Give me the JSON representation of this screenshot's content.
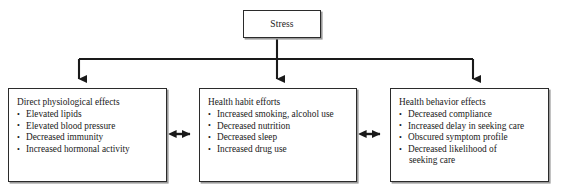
{
  "diagram": {
    "colors": {
      "box_border": "#2b2b2b",
      "box_fill": "#ffffff",
      "connector": "#1a1a1a",
      "shadow": "#9a9a9a"
    },
    "root": {
      "label": "Stress"
    },
    "nodes": [
      {
        "id": "direct-physiological-effects",
        "heading": "Direct physiological effects",
        "bullets": [
          "Elevated lipids",
          "Elevated blood pressure",
          "Decreased immunity",
          "Increased hormonal activity"
        ]
      },
      {
        "id": "health-habit-efforts",
        "heading": "Health habit efforts",
        "bullets": [
          "Increased smoking, alcohol use",
          "Decreased nutrition",
          "Decreased sleep",
          "Increased drug use"
        ]
      },
      {
        "id": "health-behavior-effects",
        "heading": "Health behavior effects",
        "bullets": [
          "Decreased compliance",
          "Increased delay in seeking care",
          "Obscured symptom profile",
          "Decreased likelihood of"
        ],
        "bullet_continuations": {
          "3": "seeking care"
        }
      }
    ],
    "connectors": [
      {
        "id": "stress-to-physiological",
        "type": "arrow-down",
        "from": "Stress",
        "to": "Direct physiological effects"
      },
      {
        "id": "stress-to-habit",
        "type": "arrow-down",
        "from": "Stress",
        "to": "Health habit efforts"
      },
      {
        "id": "stress-to-behavior",
        "type": "arrow-down",
        "from": "Stress",
        "to": "Health behavior effects"
      },
      {
        "id": "physiological-habit-link",
        "type": "double-arrow",
        "from": "Direct physiological effects",
        "to": "Health habit efforts"
      },
      {
        "id": "habit-behavior-link",
        "type": "double-arrow",
        "from": "Health habit efforts",
        "to": "Health behavior effects"
      }
    ]
  }
}
